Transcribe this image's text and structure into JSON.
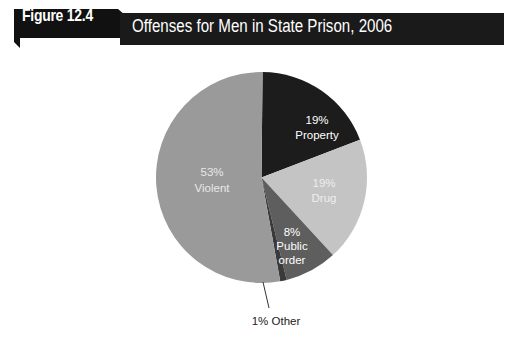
{
  "figure": {
    "label": "Figure 12.4",
    "title": "Offenses for Men in State Prison, 2006"
  },
  "chart_data": {
    "type": "pie",
    "title": "Offenses for Men in State Prison, 2006",
    "categories": [
      "Property",
      "Drug",
      "Public order",
      "Other",
      "Violent"
    ],
    "values": [
      19,
      19,
      8,
      1,
      53
    ],
    "unit": "%",
    "colors": [
      "#1c1c1c",
      "#c4c4c4",
      "#5e5e5e",
      "#3a3a3a",
      "#9a9a9a"
    ],
    "labels": [
      {
        "pct": "19%",
        "name": "Property"
      },
      {
        "pct": "19%",
        "name": "Drug"
      },
      {
        "pct": "8%",
        "name_line1": "Public",
        "name_line2": "order"
      },
      {
        "text": "1% Other"
      },
      {
        "pct": "53%",
        "name": "Violent"
      }
    ],
    "legend": "none"
  }
}
